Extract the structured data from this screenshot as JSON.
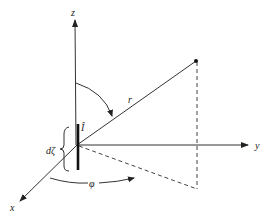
{
  "figure": {
    "labels": {
      "z_axis": "z",
      "y_axis": "y",
      "x_axis": "x",
      "radius": "r",
      "current": "Î",
      "element_length": "dζ",
      "azimuth": "φ"
    },
    "colors": {
      "line": "#333333",
      "background": "#ffffff"
    }
  }
}
